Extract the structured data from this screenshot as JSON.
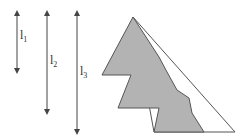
{
  "diagram": {
    "arrows": [
      {
        "id": "l1",
        "label_main": "l",
        "label_sub": "1",
        "x": 17,
        "y_top": 13,
        "y_bottom": 71
      },
      {
        "id": "l2",
        "label_main": "l",
        "label_sub": "2",
        "x": 47,
        "y_top": 13,
        "y_bottom": 112
      },
      {
        "id": "l3",
        "label_main": "l",
        "label_sub": "3",
        "x": 77,
        "y_top": 13,
        "y_bottom": 132
      }
    ],
    "triangle": {
      "outline_points": "133,17 235,132 154,132",
      "stroke": "#555555",
      "fill": "#ffffff"
    },
    "staircase_region": {
      "points": "133,17 102,75 131,75 118,108 159,108 154,132 204,132 192,113 189,98 177,90 167,72 159,57",
      "fill": "#b3b3b3",
      "stroke": "#555555"
    },
    "colors": {
      "line": "#444444",
      "gray_fill": "#b3b3b3"
    }
  }
}
